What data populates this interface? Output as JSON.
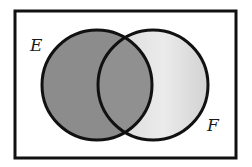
{
  "diagram": {
    "type": "venn",
    "universe": {
      "x": 15,
      "y": 11,
      "width": 221,
      "height": 147,
      "stroke": "#111111",
      "fill": "#ffffff"
    },
    "sets": [
      {
        "label": "E",
        "cx": 97,
        "cy": 85,
        "r": 55,
        "fill": "#8c8c8c",
        "label_x": 30,
        "label_y": 51
      },
      {
        "label": "F",
        "cx": 153,
        "cy": 85,
        "r": 55,
        "fill": "#dcdcdc",
        "label_x": 207,
        "label_y": 131
      }
    ],
    "intersection_fill": "#8f8f8f",
    "shaded_description": "E shaded dark, F shaded light, E∩F dark"
  }
}
